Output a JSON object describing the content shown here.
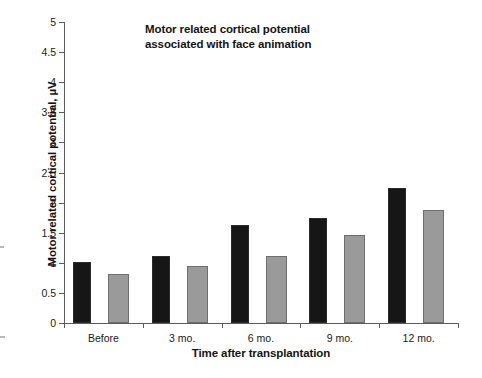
{
  "chart_data": {
    "type": "bar",
    "title": "Motor related cortical potential\nassociated with face animation",
    "xlabel": "Time after transplantation",
    "ylabel": "Motor related cortical potential, µV",
    "categories": [
      "Before",
      "3 mo.",
      "6 mo.",
      "9 mo.",
      "12 mo."
    ],
    "series": [
      {
        "name": "dark",
        "color": "#161616",
        "values": [
          1.02,
          1.12,
          1.62,
          1.74,
          2.25
        ]
      },
      {
        "name": "light",
        "color": "#9a9a9a",
        "values": [
          0.81,
          0.94,
          1.12,
          1.46,
          1.87
        ]
      }
    ],
    "ylim": [
      0,
      5
    ],
    "yticks": [
      "0",
      "0.5",
      "1",
      "1.5",
      "2",
      "2.5",
      "3",
      "3.5",
      "4",
      "4.5",
      "5"
    ],
    "ytick_values": [
      0,
      0.5,
      1,
      1.5,
      2,
      2.5,
      3,
      3.5,
      4,
      4.5,
      5
    ],
    "grid": false,
    "legend": "none"
  }
}
